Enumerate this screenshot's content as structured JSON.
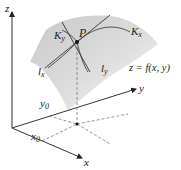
{
  "diagram": {
    "axes": {
      "z_label": "z",
      "y_label": "y",
      "x_label": "x"
    },
    "point": {
      "label": "P"
    },
    "curves": {
      "kx": {
        "base": "K",
        "sub": "x"
      },
      "ky": {
        "base": "K",
        "sub": "y"
      }
    },
    "tangent_lines": {
      "lx": {
        "base": "l",
        "sub": "x"
      },
      "ly": {
        "base": "l",
        "sub": "y"
      }
    },
    "coordinates": {
      "x0": {
        "base": "x",
        "sub": "0"
      },
      "y0": {
        "base": "y",
        "sub": "0"
      }
    },
    "surface_equation": "z = f(x, y)",
    "colors": {
      "surface": "#dcdcdc",
      "axis": "#333333",
      "dashed": "#777777",
      "line": "#333333"
    }
  }
}
